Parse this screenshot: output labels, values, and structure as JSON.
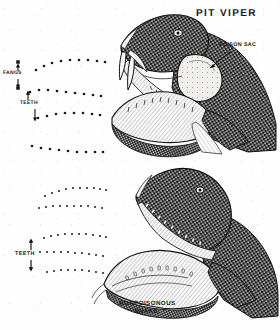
{
  "plate": {
    "kind": "scanned-illustration",
    "subject": "snake-bite-identification",
    "background_color": "#fdfdfc",
    "ink_color": "#1a1a1a"
  },
  "titles": {
    "pit_viper": "PIT VIPER"
  },
  "captions": {
    "nonpoisonous_line1": "NONPOISONOUS",
    "nonpoisonous_line2": "SNAKE."
  },
  "callouts": {
    "poison_sac": "POISON SAC",
    "fangs": "FANGS",
    "teeth_upper": "TEETH",
    "teeth_lower": "TEETH"
  },
  "bite_patterns": {
    "poisonous": {
      "name": "pit-viper-bite-pattern",
      "fang_marks": [
        {
          "x": 18,
          "y": 62,
          "size": 3.6
        },
        {
          "x": 18,
          "y": 88,
          "size": 3.6
        }
      ],
      "tooth_rows": [
        {
          "row": 1,
          "dots": [
            [
              36,
              70
            ],
            [
              44,
              66
            ],
            [
              52,
              63
            ],
            [
              61,
              61
            ],
            [
              70,
              60
            ],
            [
              79,
              60
            ],
            [
              88,
              60
            ],
            [
              97,
              61
            ],
            [
              105,
              62
            ]
          ]
        },
        {
          "row": 2,
          "dots": [
            [
              30,
              92
            ],
            [
              39,
              90
            ],
            [
              48,
              90
            ],
            [
              57,
              91
            ],
            [
              66,
              92
            ],
            [
              75,
              93
            ],
            [
              84,
              94
            ],
            [
              93,
              95
            ],
            [
              101,
              96
            ]
          ]
        },
        {
          "row": 3,
          "dots": [
            [
              38,
              118
            ],
            [
              47,
              116
            ],
            [
              56,
              114
            ],
            [
              65,
              113
            ],
            [
              74,
              113
            ],
            [
              83,
              113
            ],
            [
              92,
              114
            ],
            [
              100,
              115
            ]
          ]
        },
        {
          "row": 4,
          "dots": [
            [
              32,
              146
            ],
            [
              41,
              148
            ],
            [
              50,
              149
            ],
            [
              59,
              150
            ],
            [
              68,
              151
            ],
            [
              77,
              152
            ],
            [
              86,
              152
            ],
            [
              95,
              152
            ],
            [
              103,
              152
            ]
          ]
        }
      ]
    },
    "nonpoisonous": {
      "name": "nonpoisonous-bite-pattern",
      "fang_marks": [],
      "tooth_rows": [
        {
          "row": 1,
          "dots": [
            [
              45,
              196
            ],
            [
              52,
              193
            ],
            [
              59,
              191
            ],
            [
              66,
              189
            ],
            [
              73,
              188
            ],
            [
              80,
              188
            ],
            [
              87,
              188
            ],
            [
              94,
              188
            ],
            [
              100,
              189
            ],
            [
              106,
              190
            ]
          ]
        },
        {
          "row": 2,
          "dots": [
            [
              39,
              208
            ],
            [
              46,
              207
            ],
            [
              53,
              206
            ],
            [
              60,
              206
            ],
            [
              67,
              206
            ],
            [
              74,
              206
            ],
            [
              81,
              206
            ],
            [
              88,
              206
            ],
            [
              95,
              207
            ],
            [
              102,
              208
            ]
          ]
        },
        {
          "row": 3,
          "dots": [
            [
              44,
              238
            ],
            [
              51,
              236
            ],
            [
              58,
              235
            ],
            [
              65,
              234
            ],
            [
              72,
              234
            ],
            [
              79,
              234
            ],
            [
              86,
              234
            ],
            [
              93,
              235
            ],
            [
              100,
              236
            ],
            [
              106,
              237
            ]
          ]
        },
        {
          "row": 4,
          "dots": [
            [
              40,
              252
            ],
            [
              47,
              252
            ],
            [
              54,
              252
            ],
            [
              61,
              252
            ],
            [
              68,
              252
            ],
            [
              75,
              253
            ],
            [
              82,
              253
            ],
            [
              89,
              254
            ],
            [
              96,
              255
            ],
            [
              103,
              256
            ]
          ]
        },
        {
          "row": 5,
          "dots": [
            [
              47,
              272
            ],
            [
              54,
              271
            ],
            [
              61,
              270
            ],
            [
              68,
              270
            ],
            [
              75,
              270
            ],
            [
              82,
              270
            ],
            [
              89,
              271
            ],
            [
              96,
              272
            ],
            [
              103,
              273
            ]
          ]
        }
      ]
    }
  },
  "figures": [
    {
      "name": "pit-viper-head",
      "description": "Open-mouthed pit viper head in profile facing left, scaled skin rendered in cross-hatched stipple, long curved hollow fangs on the upper jaw, pale venom gland behind the eye.",
      "parts": [
        "upper-jaw",
        "lower-jaw",
        "fang-pair",
        "poison-sac",
        "eye",
        "scales",
        "tongue"
      ]
    },
    {
      "name": "nonpoisonous-snake-head",
      "description": "Open-mouthed nonpoisonous snake head in profile facing left, rows of small even teeth on both jaws, no fangs and no venom gland.",
      "parts": [
        "upper-jaw",
        "lower-jaw",
        "tooth-rows",
        "eye",
        "scales"
      ]
    }
  ],
  "arrows": {
    "poison_sac_leader": {
      "from": [
        230,
        52
      ],
      "to": [
        209,
        67
      ]
    },
    "fangs_up": {
      "from": [
        18,
        71
      ],
      "to": [
        18,
        64
      ]
    },
    "fangs_down": {
      "from": [
        18,
        82
      ],
      "to": [
        18,
        88
      ]
    },
    "teeth_upper_up": {
      "from": [
        28,
        101
      ],
      "to": [
        28,
        92
      ]
    },
    "teeth_upper_down": {
      "from": [
        35,
        110
      ],
      "to": [
        35,
        122
      ]
    },
    "teeth_lower_up": {
      "from": [
        31,
        251
      ],
      "to": [
        31,
        238
      ]
    },
    "teeth_lower_down": {
      "from": [
        31,
        261
      ],
      "to": [
        31,
        272
      ]
    }
  }
}
